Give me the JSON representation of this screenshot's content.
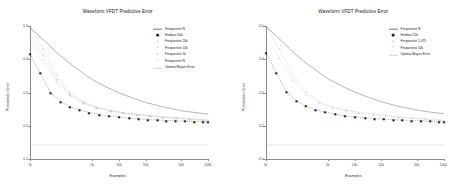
{
  "chart_data": [
    {
      "panel": "left",
      "type": "line",
      "title": "Waveform VFDT Predictive Error",
      "xlabel": "Examples",
      "ylabel": "Probabilistic Error",
      "xscale": "log",
      "xlim": [
        1000,
        100000
      ],
      "ylim": [
        0.1,
        0.5
      ],
      "xticks": [
        1000,
        5000,
        10000,
        20000,
        50000,
        100000
      ],
      "xticklabels": [
        "1k",
        "5k",
        "10k",
        "20k",
        "50k",
        "100k"
      ],
      "yticks": [
        0.1,
        0.2,
        0.3,
        0.4,
        0.5
      ],
      "yticklabels": [
        "0.1",
        "0.2",
        "0.3",
        "0.4",
        "0.5"
      ],
      "grid": false,
      "legend_position": "top-right",
      "series": [
        {
          "name": "Frequentist N",
          "style": "line",
          "color": "#777777",
          "marker": "none",
          "x": [
            1000,
            1500,
            2000,
            3000,
            5000,
            7000,
            10000,
            15000,
            20000,
            30000,
            50000,
            70000,
            100000
          ],
          "y": [
            0.495,
            0.452,
            0.42,
            0.381,
            0.339,
            0.318,
            0.299,
            0.281,
            0.27,
            0.258,
            0.245,
            0.24,
            0.235
          ]
        },
        {
          "name": "Holdout 50k",
          "style": "points",
          "color": "#111111",
          "marker": "square",
          "x": [
            1000,
            1300,
            1700,
            2200,
            2800,
            3600,
            4600,
            6000,
            7700,
            10000,
            13000,
            16500,
            21000,
            27000,
            34000,
            43000,
            55000,
            70000,
            88000,
            100000
          ],
          "y": [
            0.415,
            0.358,
            0.3,
            0.272,
            0.258,
            0.247,
            0.24,
            0.234,
            0.229,
            0.226,
            0.223,
            0.221,
            0.219,
            0.217,
            0.216,
            0.215,
            0.214,
            0.213,
            0.212,
            0.212
          ]
        },
        {
          "name": "Frequentist 20k",
          "style": "points",
          "color": "#9a9a9a",
          "marker": "triangle",
          "x": [
            1000,
            1400,
            2000,
            2800,
            4000,
            5600,
            8000,
            11000,
            16000,
            22000,
            31000,
            44000,
            62000,
            88000,
            100000
          ],
          "y": [
            0.498,
            0.43,
            0.352,
            0.3,
            0.272,
            0.256,
            0.246,
            0.239,
            0.233,
            0.229,
            0.225,
            0.222,
            0.219,
            0.216,
            0.215
          ]
        },
        {
          "name": "Frequentist 10k",
          "style": "points",
          "color": "#a8a8a8",
          "marker": "plus",
          "x": [
            1000,
            1400,
            2000,
            2800,
            4000,
            5600,
            8000,
            11000,
            16000,
            22000,
            31000,
            44000,
            62000,
            88000,
            100000
          ],
          "y": [
            0.478,
            0.412,
            0.341,
            0.295,
            0.27,
            0.255,
            0.246,
            0.24,
            0.234,
            0.23,
            0.226,
            0.223,
            0.22,
            0.217,
            0.216
          ]
        },
        {
          "name": "Frequentist 5k",
          "style": "points",
          "color": "#b4b4b4",
          "marker": "cross",
          "x": [
            1000,
            1400,
            2000,
            2800,
            4000,
            5600,
            8000,
            11000,
            16000,
            22000,
            31000,
            44000,
            62000,
            88000,
            100000
          ],
          "y": [
            0.462,
            0.398,
            0.334,
            0.292,
            0.268,
            0.254,
            0.245,
            0.239,
            0.234,
            0.23,
            0.227,
            0.224,
            0.221,
            0.218,
            0.217
          ]
        },
        {
          "name": "Frequentist N",
          "style": "points",
          "color": "#bdbdbd",
          "marker": "diamond",
          "x": [
            1000,
            1400,
            2000,
            2800,
            4000,
            5600,
            8000,
            11000,
            16000,
            22000,
            31000,
            44000,
            62000,
            88000,
            100000
          ],
          "y": [
            0.45,
            0.388,
            0.328,
            0.289,
            0.266,
            0.253,
            0.245,
            0.239,
            0.234,
            0.231,
            0.227,
            0.224,
            0.222,
            0.219,
            0.218
          ]
        },
        {
          "name": "Optimal Bayes Error",
          "style": "hline",
          "color": "#c4c4c4",
          "marker": "none",
          "y_const": 0.142
        }
      ]
    },
    {
      "panel": "right",
      "type": "line",
      "title": "Waveform VFDT Predictive Error",
      "xlabel": "Examples",
      "ylabel": "Probabilistic Error",
      "xscale": "log",
      "xlim": [
        1000,
        100000
      ],
      "ylim": [
        0.1,
        0.5
      ],
      "xticks": [
        1000,
        5000,
        10000,
        20000,
        50000,
        100000
      ],
      "xticklabels": [
        "1k",
        "5k",
        "10k",
        "20k",
        "50k",
        "100k"
      ],
      "yticks": [
        0.1,
        0.2,
        0.3,
        0.4,
        0.5
      ],
      "yticklabels": [
        "0.1",
        "0.2",
        "0.3",
        "0.4",
        "0.5"
      ],
      "grid": false,
      "legend_position": "top-right",
      "series": [
        {
          "name": "Frequentist N",
          "style": "line",
          "color": "#777777",
          "marker": "none",
          "x": [
            1000,
            1500,
            2000,
            3000,
            5000,
            7000,
            10000,
            15000,
            20000,
            30000,
            50000,
            70000,
            100000
          ],
          "y": [
            0.498,
            0.455,
            0.422,
            0.383,
            0.341,
            0.32,
            0.301,
            0.283,
            0.272,
            0.259,
            0.247,
            0.241,
            0.236
          ]
        },
        {
          "name": "Holdout 50k",
          "style": "points",
          "color": "#111111",
          "marker": "square",
          "x": [
            1000,
            1300,
            1700,
            2200,
            2800,
            3600,
            4600,
            6000,
            7700,
            10000,
            13000,
            16500,
            21000,
            27000,
            34000,
            43000,
            55000,
            70000,
            88000,
            100000
          ],
          "y": [
            0.418,
            0.36,
            0.302,
            0.274,
            0.259,
            0.248,
            0.241,
            0.235,
            0.23,
            0.227,
            0.224,
            0.222,
            0.22,
            0.218,
            0.217,
            0.216,
            0.215,
            0.214,
            0.213,
            0.213
          ]
        },
        {
          "name": "Frequentist 1.075",
          "style": "points",
          "color": "#9a9a9a",
          "marker": "triangle",
          "x": [
            1000,
            1400,
            2000,
            2800,
            4000,
            5600,
            8000,
            11000,
            16000,
            22000,
            31000,
            44000,
            62000,
            88000,
            100000
          ],
          "y": [
            0.5,
            0.432,
            0.354,
            0.302,
            0.273,
            0.257,
            0.247,
            0.24,
            0.234,
            0.23,
            0.226,
            0.223,
            0.22,
            0.217,
            0.216
          ]
        },
        {
          "name": "Frequentist 50k",
          "style": "points",
          "color": "#b0b0b0",
          "marker": "plus",
          "x": [
            1000,
            1400,
            2000,
            2800,
            4000,
            5600,
            8000,
            11000,
            16000,
            22000,
            31000,
            44000,
            62000,
            88000,
            100000
          ],
          "y": [
            0.47,
            0.405,
            0.338,
            0.294,
            0.269,
            0.255,
            0.246,
            0.24,
            0.235,
            0.231,
            0.227,
            0.224,
            0.221,
            0.218,
            0.217
          ]
        },
        {
          "name": "Optimal Bayes Error",
          "style": "hline",
          "color": "#c4c4c4",
          "marker": "none",
          "y_const": 0.142
        }
      ]
    }
  ]
}
